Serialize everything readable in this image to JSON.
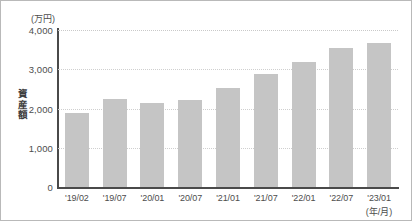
{
  "chart_data": {
    "type": "bar",
    "title": "",
    "subtitle": "",
    "xlabel": "(年/月)",
    "ylabel": "資産額",
    "y_unit_label": "(万円)",
    "categories": [
      "'19/02",
      "'19/07",
      "'20/01",
      "'20/07",
      "'21/01",
      "'21/07",
      "'22/01",
      "'22/07",
      "'23/01"
    ],
    "values": [
      1880,
      2240,
      2140,
      2210,
      2520,
      2880,
      3180,
      3540,
      3680
    ],
    "ylim": [
      0,
      4000
    ],
    "yticks": [
      0,
      1000,
      2000,
      3000,
      4000
    ],
    "ytick_labels": [
      "0",
      "1,000",
      "2,000",
      "3,000",
      "4,000"
    ],
    "grid": true,
    "legend": false,
    "bar_color": "#c5c5c5",
    "axis_color": "#4a4a4a",
    "grid_color": "#cfcfcf",
    "text_color": "#4d4d4d"
  },
  "y_axis_title_chars": [
    "資",
    "産",
    "額"
  ]
}
